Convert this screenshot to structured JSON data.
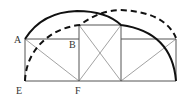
{
  "diagram": {
    "colors": {
      "background": "#ffffff",
      "thin_lines": "#8a8a8a",
      "frame_lines": "#555555",
      "arcs": "#111111",
      "labels": "#333333"
    },
    "points": {
      "A": {
        "label": "A",
        "x": 25,
        "y": 39
      },
      "B": {
        "label": "B",
        "x": 79,
        "y": 39
      },
      "E": {
        "label": "E",
        "x": 25,
        "y": 81
      },
      "F": {
        "label": "F",
        "x": 79,
        "y": 81
      }
    },
    "labels": [
      {
        "id": "A",
        "text": "A",
        "x": 14,
        "y": 43
      },
      {
        "id": "B",
        "text": "B",
        "x": 69,
        "y": 48
      },
      {
        "id": "E",
        "text": "E",
        "x": 16,
        "y": 94
      },
      {
        "id": "F",
        "text": "F",
        "x": 75,
        "y": 94
      }
    ],
    "shapes": {
      "left_rectangle": {
        "x1": 25,
        "y1": 39,
        "x2": 79,
        "y2": 81
      },
      "middle_square": {
        "x1": 79,
        "y1": 25,
        "x2": 121,
        "y2": 81
      },
      "right_rectangle": {
        "x1": 121,
        "y1": 39,
        "x2": 176,
        "y2": 81
      },
      "baseline": {
        "x1": 25,
        "x2": 176,
        "y": 81
      },
      "arc_solid": "A through top to middle square top-right corner then down to bottom-right",
      "arc_dashed": "E up through middle square top-left corner to top then down to right rectangle top-right"
    }
  }
}
